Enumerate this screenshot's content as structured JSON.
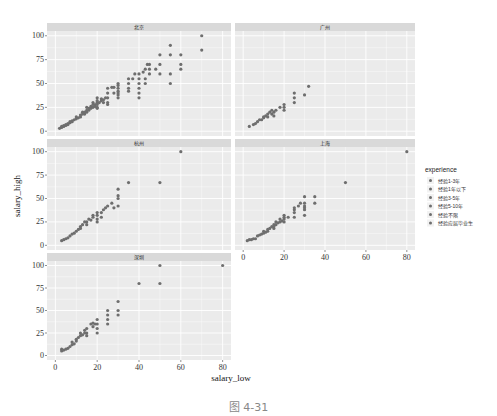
{
  "figure": {
    "caption": "图 4-31"
  },
  "chart_data": {
    "type": "scatter",
    "title": "",
    "xlabel": "salary_low",
    "ylabel": "salary_high",
    "xlim": [
      0,
      80
    ],
    "ylim": [
      0,
      100
    ],
    "x_ticks": [
      0,
      20,
      40,
      60,
      80
    ],
    "y_ticks": [
      0,
      25,
      50,
      75,
      100
    ],
    "grid": true,
    "legend": {
      "title": "experience",
      "position": "right",
      "entries": [
        "经验1-3年",
        "经验1年以下",
        "经验3-5年",
        "经验5-10年",
        "经验不限",
        "经验应届毕业生"
      ]
    },
    "facets": [
      {
        "name": "北京",
        "points": [
          [
            2,
            3
          ],
          [
            3,
            4
          ],
          [
            3,
            5
          ],
          [
            4,
            5
          ],
          [
            4,
            6
          ],
          [
            5,
            6
          ],
          [
            5,
            7
          ],
          [
            6,
            7
          ],
          [
            6,
            8
          ],
          [
            7,
            9
          ],
          [
            7,
            10
          ],
          [
            8,
            10
          ],
          [
            8,
            11
          ],
          [
            9,
            12
          ],
          [
            10,
            13
          ],
          [
            10,
            15
          ],
          [
            11,
            14
          ],
          [
            12,
            15
          ],
          [
            12,
            17
          ],
          [
            13,
            18
          ],
          [
            13,
            20
          ],
          [
            14,
            18
          ],
          [
            14,
            20
          ],
          [
            15,
            20
          ],
          [
            15,
            22
          ],
          [
            15,
            25
          ],
          [
            16,
            22
          ],
          [
            16,
            24
          ],
          [
            17,
            24
          ],
          [
            17,
            26
          ],
          [
            18,
            25
          ],
          [
            18,
            28
          ],
          [
            18,
            30
          ],
          [
            19,
            26
          ],
          [
            19,
            28
          ],
          [
            20,
            24
          ],
          [
            20,
            25
          ],
          [
            20,
            28
          ],
          [
            20,
            30
          ],
          [
            20,
            32
          ],
          [
            20,
            35
          ],
          [
            21,
            30
          ],
          [
            22,
            32
          ],
          [
            22,
            34
          ],
          [
            23,
            30
          ],
          [
            23,
            33
          ],
          [
            24,
            35
          ],
          [
            25,
            28
          ],
          [
            25,
            30
          ],
          [
            25,
            35
          ],
          [
            25,
            40
          ],
          [
            25,
            45
          ],
          [
            27,
            46
          ],
          [
            28,
            40
          ],
          [
            28,
            46
          ],
          [
            30,
            35
          ],
          [
            30,
            38
          ],
          [
            30,
            40
          ],
          [
            30,
            42
          ],
          [
            30,
            45
          ],
          [
            30,
            48
          ],
          [
            30,
            50
          ],
          [
            35,
            42
          ],
          [
            35,
            45
          ],
          [
            35,
            50
          ],
          [
            35,
            55
          ],
          [
            37,
            55
          ],
          [
            38,
            60
          ],
          [
            40,
            35
          ],
          [
            40,
            40
          ],
          [
            40,
            45
          ],
          [
            40,
            50
          ],
          [
            40,
            55
          ],
          [
            40,
            60
          ],
          [
            42,
            62
          ],
          [
            43,
            50
          ],
          [
            43,
            55
          ],
          [
            43,
            65
          ],
          [
            44,
            70
          ],
          [
            45,
            60
          ],
          [
            45,
            65
          ],
          [
            45,
            70
          ],
          [
            48,
            65
          ],
          [
            50,
            60
          ],
          [
            50,
            70
          ],
          [
            50,
            80
          ],
          [
            55,
            50
          ],
          [
            55,
            60
          ],
          [
            55,
            80
          ],
          [
            55,
            90
          ],
          [
            60,
            65
          ],
          [
            60,
            70
          ],
          [
            60,
            80
          ],
          [
            70,
            85
          ],
          [
            70,
            100
          ]
        ]
      },
      {
        "name": "广州",
        "points": [
          [
            3,
            5
          ],
          [
            5,
            7
          ],
          [
            6,
            8
          ],
          [
            7,
            10
          ],
          [
            8,
            12
          ],
          [
            9,
            12
          ],
          [
            10,
            14
          ],
          [
            10,
            15
          ],
          [
            11,
            16
          ],
          [
            12,
            15
          ],
          [
            12,
            18
          ],
          [
            13,
            20
          ],
          [
            14,
            18
          ],
          [
            14,
            22
          ],
          [
            15,
            16
          ],
          [
            15,
            20
          ],
          [
            16,
            22
          ],
          [
            18,
            25
          ],
          [
            20,
            22
          ],
          [
            20,
            25
          ],
          [
            20,
            28
          ],
          [
            25,
            30
          ],
          [
            25,
            35
          ],
          [
            25,
            40
          ],
          [
            30,
            38
          ],
          [
            32,
            47
          ]
        ]
      },
      {
        "name": "杭州",
        "points": [
          [
            3,
            5
          ],
          [
            4,
            6
          ],
          [
            5,
            7
          ],
          [
            6,
            8
          ],
          [
            7,
            10
          ],
          [
            8,
            12
          ],
          [
            9,
            13
          ],
          [
            10,
            15
          ],
          [
            11,
            17
          ],
          [
            12,
            18
          ],
          [
            12,
            20
          ],
          [
            13,
            22
          ],
          [
            14,
            25
          ],
          [
            15,
            22
          ],
          [
            15,
            25
          ],
          [
            16,
            28
          ],
          [
            17,
            27
          ],
          [
            18,
            30
          ],
          [
            18,
            32
          ],
          [
            20,
            25
          ],
          [
            20,
            28
          ],
          [
            20,
            32
          ],
          [
            20,
            35
          ],
          [
            22,
            30
          ],
          [
            22,
            35
          ],
          [
            23,
            38
          ],
          [
            24,
            40
          ],
          [
            25,
            42
          ],
          [
            27,
            45
          ],
          [
            28,
            40
          ],
          [
            30,
            42
          ],
          [
            30,
            50
          ],
          [
            30,
            53
          ],
          [
            30,
            60
          ],
          [
            35,
            67
          ],
          [
            50,
            67
          ],
          [
            60,
            100
          ]
        ]
      },
      {
        "name": "上海",
        "points": [
          [
            2,
            5
          ],
          [
            3,
            6
          ],
          [
            4,
            6
          ],
          [
            5,
            7
          ],
          [
            6,
            7
          ],
          [
            7,
            10
          ],
          [
            8,
            11
          ],
          [
            9,
            12
          ],
          [
            10,
            13
          ],
          [
            10,
            15
          ],
          [
            11,
            14
          ],
          [
            12,
            15
          ],
          [
            12,
            17
          ],
          [
            13,
            18
          ],
          [
            14,
            20
          ],
          [
            15,
            18
          ],
          [
            15,
            20
          ],
          [
            15,
            22
          ],
          [
            16,
            22
          ],
          [
            16,
            25
          ],
          [
            17,
            24
          ],
          [
            18,
            25
          ],
          [
            18,
            28
          ],
          [
            19,
            26
          ],
          [
            20,
            25
          ],
          [
            20,
            28
          ],
          [
            20,
            30
          ],
          [
            20,
            32
          ],
          [
            22,
            30
          ],
          [
            25,
            30
          ],
          [
            25,
            35
          ],
          [
            25,
            38
          ],
          [
            25,
            40
          ],
          [
            27,
            42
          ],
          [
            28,
            45
          ],
          [
            30,
            32
          ],
          [
            30,
            38
          ],
          [
            30,
            40
          ],
          [
            30,
            42
          ],
          [
            30,
            45
          ],
          [
            30,
            52
          ],
          [
            35,
            45
          ],
          [
            35,
            52
          ],
          [
            50,
            67
          ],
          [
            80,
            100
          ]
        ]
      },
      {
        "name": "深圳",
        "points": [
          [
            3,
            5
          ],
          [
            3,
            7
          ],
          [
            4,
            6
          ],
          [
            5,
            7
          ],
          [
            6,
            8
          ],
          [
            7,
            10
          ],
          [
            8,
            12
          ],
          [
            8,
            15
          ],
          [
            9,
            13
          ],
          [
            10,
            16
          ],
          [
            10,
            18
          ],
          [
            11,
            20
          ],
          [
            12,
            22
          ],
          [
            12,
            25
          ],
          [
            13,
            23
          ],
          [
            14,
            25
          ],
          [
            14,
            28
          ],
          [
            15,
            22
          ],
          [
            15,
            25
          ],
          [
            15,
            30
          ],
          [
            17,
            35
          ],
          [
            18,
            32
          ],
          [
            18,
            36
          ],
          [
            19,
            35
          ],
          [
            20,
            25
          ],
          [
            20,
            30
          ],
          [
            20,
            35
          ],
          [
            20,
            40
          ],
          [
            25,
            35
          ],
          [
            25,
            40
          ],
          [
            25,
            45
          ],
          [
            25,
            50
          ],
          [
            30,
            45
          ],
          [
            30,
            50
          ],
          [
            30,
            60
          ],
          [
            40,
            80
          ],
          [
            50,
            80
          ],
          [
            50,
            100
          ],
          [
            80,
            100
          ]
        ]
      }
    ]
  }
}
